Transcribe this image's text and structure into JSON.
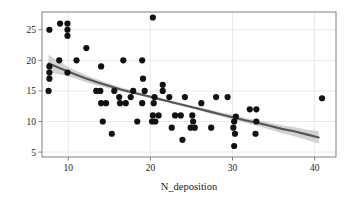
{
  "chart_data": {
    "type": "scatter",
    "title": "",
    "xlabel": "N_deposition",
    "ylabel": "Species_counts",
    "xlim": [
      6.8,
      42.6
    ],
    "ylim": [
      4.2,
      27.9
    ],
    "xticks": [
      10,
      20,
      30,
      40
    ],
    "xticklabels": [
      "10",
      "20",
      "30",
      "40"
    ],
    "yticks": [
      5,
      10,
      15,
      20,
      25
    ],
    "yticklabels": [
      "5",
      "10",
      "15",
      "20",
      "25"
    ],
    "grid": true,
    "grid_color": "#e4e4e4",
    "legend": "none",
    "point_color": "#111111",
    "point_size": 3.1,
    "line_color": "#555555",
    "band_color": "#c4c4c4",
    "frame_color": "#808080",
    "background": "#ffffff",
    "regression": {
      "description": "loess/log fitted trend with shaded confidence band, decreasing",
      "x": [
        7.6,
        9.0,
        10.5,
        12.0,
        13.5,
        15.0,
        16.5,
        18.0,
        19.5,
        21.0,
        22.5,
        24.0,
        25.5,
        27.0,
        28.5,
        30.0,
        31.5,
        33.0,
        34.5,
        36.0,
        37.5,
        39.0,
        40.5
      ],
      "y": [
        19.5,
        18.7,
        17.9,
        17.1,
        16.4,
        15.8,
        15.2,
        14.7,
        14.2,
        13.7,
        13.2,
        12.7,
        12.2,
        11.7,
        11.2,
        10.7,
        10.2,
        9.8,
        9.3,
        8.8,
        8.4,
        7.9,
        7.4
      ],
      "ci_lower": [
        18.1,
        17.7,
        17.2,
        16.5,
        15.9,
        15.4,
        14.9,
        14.4,
        14.0,
        13.5,
        13.0,
        12.5,
        12.0,
        11.4,
        10.9,
        10.3,
        9.8,
        9.3,
        8.7,
        8.1,
        7.6,
        7.0,
        6.4
      ],
      "ci_upper": [
        20.9,
        19.7,
        18.6,
        17.7,
        16.9,
        16.2,
        15.5,
        15.0,
        14.4,
        13.9,
        13.4,
        12.9,
        12.4,
        12.0,
        11.5,
        11.1,
        10.6,
        10.2,
        9.8,
        9.4,
        9.1,
        8.7,
        8.4
      ]
    },
    "points": [
      {
        "x": 7.7,
        "y": 25.0
      },
      {
        "x": 9.0,
        "y": 26.0
      },
      {
        "x": 9.9,
        "y": 26.0
      },
      {
        "x": 9.9,
        "y": 25.0
      },
      {
        "x": 9.9,
        "y": 24.0
      },
      {
        "x": 12.2,
        "y": 22.0
      },
      {
        "x": 20.3,
        "y": 27.0
      },
      {
        "x": 7.7,
        "y": 19.0
      },
      {
        "x": 8.9,
        "y": 20.0
      },
      {
        "x": 9.9,
        "y": 18.0
      },
      {
        "x": 11.0,
        "y": 20.0
      },
      {
        "x": 14.0,
        "y": 19.0
      },
      {
        "x": 16.7,
        "y": 20.0
      },
      {
        "x": 19.0,
        "y": 20.0
      },
      {
        "x": 7.7,
        "y": 18.0
      },
      {
        "x": 7.7,
        "y": 17.0
      },
      {
        "x": 7.6,
        "y": 15.0
      },
      {
        "x": 19.1,
        "y": 17.0
      },
      {
        "x": 21.5,
        "y": 16.0
      },
      {
        "x": 21.5,
        "y": 15.0
      },
      {
        "x": 13.4,
        "y": 15.0
      },
      {
        "x": 13.9,
        "y": 15.0
      },
      {
        "x": 15.6,
        "y": 15.0
      },
      {
        "x": 17.9,
        "y": 15.0
      },
      {
        "x": 19.3,
        "y": 15.0
      },
      {
        "x": 20.5,
        "y": 14.0
      },
      {
        "x": 22.3,
        "y": 14.0
      },
      {
        "x": 24.2,
        "y": 14.0
      },
      {
        "x": 28.0,
        "y": 14.0
      },
      {
        "x": 29.4,
        "y": 14.0
      },
      {
        "x": 16.2,
        "y": 14.0
      },
      {
        "x": 17.6,
        "y": 14.0
      },
      {
        "x": 20.4,
        "y": 13.0
      },
      {
        "x": 19.0,
        "y": 13.0
      },
      {
        "x": 14.0,
        "y": 13.0
      },
      {
        "x": 14.6,
        "y": 13.0
      },
      {
        "x": 16.3,
        "y": 13.0
      },
      {
        "x": 17.0,
        "y": 13.0
      },
      {
        "x": 26.2,
        "y": 13.0
      },
      {
        "x": 32.1,
        "y": 12.0
      },
      {
        "x": 32.9,
        "y": 12.0
      },
      {
        "x": 20.3,
        "y": 11.0
      },
      {
        "x": 21.0,
        "y": 11.0
      },
      {
        "x": 23.0,
        "y": 11.0
      },
      {
        "x": 23.7,
        "y": 11.0
      },
      {
        "x": 25.1,
        "y": 11.0
      },
      {
        "x": 14.2,
        "y": 10.0
      },
      {
        "x": 18.4,
        "y": 10.0
      },
      {
        "x": 20.2,
        "y": 10.0
      },
      {
        "x": 20.6,
        "y": 10.0
      },
      {
        "x": 25.2,
        "y": 10.0
      },
      {
        "x": 30.2,
        "y": 10.0
      },
      {
        "x": 32.9,
        "y": 10.0
      },
      {
        "x": 22.6,
        "y": 9.0
      },
      {
        "x": 24.9,
        "y": 9.0
      },
      {
        "x": 25.4,
        "y": 9.0
      },
      {
        "x": 27.4,
        "y": 9.0
      },
      {
        "x": 30.1,
        "y": 9.0
      },
      {
        "x": 30.3,
        "y": 8.0
      },
      {
        "x": 32.8,
        "y": 8.0
      },
      {
        "x": 15.3,
        "y": 8.0
      },
      {
        "x": 23.9,
        "y": 7.0
      },
      {
        "x": 30.2,
        "y": 6.0
      },
      {
        "x": 30.4,
        "y": 10.8
      },
      {
        "x": 40.9,
        "y": 13.8
      }
    ]
  }
}
